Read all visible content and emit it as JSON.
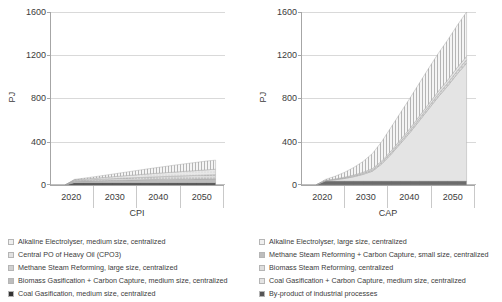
{
  "chart_data": [
    {
      "type": "area",
      "id": "cpi",
      "title": "",
      "xlabel": "CPI",
      "ylabel": "PJ",
      "xlim": [
        2015,
        2052
      ],
      "ylim": [
        0,
        1600
      ],
      "yticks": [
        0,
        400,
        800,
        1200,
        1600
      ],
      "xticks": [
        2020,
        2030,
        2040,
        2050
      ],
      "grid": true,
      "legend_position": "below",
      "x": [
        2018,
        2020,
        2022,
        2024,
        2026,
        2028,
        2030,
        2032,
        2034,
        2036,
        2038,
        2040,
        2042,
        2044,
        2046,
        2048,
        2050
      ],
      "series": [
        {
          "name": "Coal Gasification, medium size, centralized",
          "fill": "#4a4a4a",
          "pattern": "solid",
          "values": [
            0,
            20,
            20,
            20,
            20,
            20,
            20,
            20,
            20,
            20,
            20,
            20,
            20,
            20,
            20,
            20,
            20
          ]
        },
        {
          "name": "Biomass Gasification + Carbon Capture, medium size, centralized",
          "fill": "#bdbdbd",
          "pattern": "solid",
          "values": [
            0,
            14,
            16,
            18,
            20,
            22,
            24,
            26,
            28,
            30,
            31,
            32,
            33,
            34,
            35,
            36,
            37
          ]
        },
        {
          "name": "Methane Steam Reforming, large size, centralized",
          "fill": "#d0d0d0",
          "pattern": "dots",
          "values": [
            0,
            8,
            10,
            12,
            14,
            16,
            18,
            20,
            22,
            24,
            26,
            28,
            30,
            32,
            34,
            36,
            38
          ]
        },
        {
          "name": "Central PO of Heavy Oil (CPO3)",
          "fill": "#e2e2e2",
          "pattern": "dots-fine",
          "values": [
            0,
            6,
            9,
            12,
            15,
            18,
            21,
            24,
            27,
            30,
            33,
            36,
            39,
            42,
            45,
            48,
            51
          ]
        },
        {
          "name": "Alkaline Electrolyser, medium size, centralized",
          "fill": "#efefef",
          "pattern": "vertical-hatch",
          "values": [
            0,
            4,
            8,
            13,
            18,
            24,
            30,
            36,
            42,
            48,
            54,
            60,
            66,
            71,
            76,
            81,
            84
          ]
        }
      ],
      "total_2050": 230
    },
    {
      "type": "area",
      "id": "cap",
      "title": "",
      "xlabel": "CAP",
      "ylabel": "PJ",
      "xlim": [
        2015,
        2052
      ],
      "ylim": [
        0,
        1600
      ],
      "yticks": [
        0,
        400,
        800,
        1200,
        1600
      ],
      "xticks": [
        2020,
        2030,
        2040,
        2050
      ],
      "grid": true,
      "legend_position": "below",
      "x": [
        2018,
        2020,
        2022,
        2024,
        2026,
        2028,
        2030,
        2032,
        2034,
        2036,
        2038,
        2040,
        2042,
        2044,
        2046,
        2048,
        2050
      ],
      "series": [
        {
          "name": "By-product of industrial processes",
          "fill": "#6b6b6b",
          "pattern": "solid",
          "values": [
            0,
            36,
            36,
            36,
            36,
            36,
            36,
            36,
            36,
            36,
            36,
            36,
            36,
            36,
            36,
            36,
            36
          ]
        },
        {
          "name": "Coal Gasification + Carbon Capture, medium size, centralized",
          "fill": "#e4e4e4",
          "pattern": "solid",
          "values": [
            0,
            4,
            12,
            24,
            40,
            62,
            92,
            160,
            250,
            350,
            450,
            560,
            670,
            780,
            880,
            990,
            1090
          ]
        },
        {
          "name": "Biomass Steam Reforming, centralized",
          "fill": "#dedede",
          "pattern": "dots",
          "values": [
            0,
            2,
            4,
            6,
            8,
            10,
            12,
            14,
            16,
            18,
            20,
            22,
            24,
            26,
            28,
            30,
            32
          ]
        },
        {
          "name": "Methane Steam Reforming + Carbon Capture, small size, centralized",
          "fill": "#cfcfcf",
          "pattern": "dots-fine",
          "values": [
            0,
            2,
            4,
            6,
            8,
            10,
            12,
            14,
            16,
            18,
            20,
            22,
            24,
            26,
            28,
            30,
            32
          ]
        },
        {
          "name": "Alkaline Electrolyser, large size, centralized",
          "fill": "#f0f0f0",
          "pattern": "vertical-hatch",
          "values": [
            0,
            8,
            24,
            44,
            70,
            100,
            140,
            180,
            220,
            250,
            280,
            305,
            330,
            350,
            370,
            390,
            410
          ]
        }
      ],
      "total_2050": 1580
    }
  ],
  "panels": [
    {
      "id": "cpi",
      "ylabel": "PJ",
      "xaxis_title": "CPI",
      "yticks": [
        "1600",
        "1200",
        "800",
        "400",
        "0"
      ],
      "xticks": [
        "2020",
        "2030",
        "2040",
        "2050"
      ]
    },
    {
      "id": "cap",
      "ylabel": "PJ",
      "xaxis_title": "CAP",
      "yticks": [
        "1600",
        "1200",
        "800",
        "400",
        "0"
      ],
      "xticks": [
        "2020",
        "2030",
        "2040",
        "2050"
      ]
    }
  ],
  "legend": {
    "left": [
      {
        "label": "Alkaline Electrolyser, medium size, centralized",
        "swatch": "vertical-hatch",
        "color": "#efefef"
      },
      {
        "label": "Central PO of Heavy Oil (CPO3)",
        "swatch": "dots-fine",
        "color": "#e2e2e2"
      },
      {
        "label": "Methane Steam Reforming, large size, centralized",
        "swatch": "dots",
        "color": "#d0d0d0"
      },
      {
        "label": "Biomass Gasification + Carbon Capture, medium size, centralized",
        "swatch": "solid-light",
        "color": "#bdbdbd"
      },
      {
        "label": "Coal Gasification, medium size, centralized",
        "swatch": "solid-dark",
        "color": "#333333"
      }
    ],
    "right": [
      {
        "label": "Alkaline Electrolyser, large size, centralized",
        "swatch": "vertical-hatch",
        "color": "#f0f0f0"
      },
      {
        "label": "Methane Steam Reforming + Carbon Capture, small size, centralized",
        "swatch": "solid-mid",
        "color": "#bdbdbd"
      },
      {
        "label": "Biomass Steam Reforming, centralized",
        "swatch": "dots",
        "color": "#dedede"
      },
      {
        "label": "Coal Gasification + Carbon Capture, medium size, centralized",
        "swatch": "solid-light",
        "color": "#e4e4e4"
      },
      {
        "label": "By-product of industrial processes",
        "swatch": "solid-dark",
        "color": "#555555"
      }
    ]
  }
}
